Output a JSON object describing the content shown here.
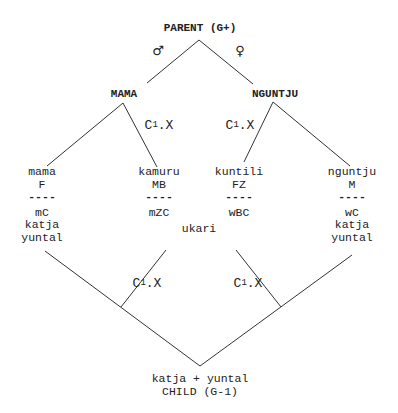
{
  "diagram": {
    "top": {
      "label": "PARENT (G+)"
    },
    "symbols": {
      "male": "♂",
      "female": "♀"
    },
    "parents": [
      {
        "id": "mama",
        "label": "MAMA"
      },
      {
        "id": "nguntju",
        "label": "NGUNTJU"
      }
    ],
    "relation_label": {
      "base": "C",
      "superscript": "1",
      "suffix": ".X"
    },
    "columns": [
      {
        "term": "mama",
        "gloss": "F",
        "separator": "----",
        "lines": [
          "mC",
          "katja",
          "yuntal"
        ]
      },
      {
        "term": "kamuru",
        "gloss": "MB",
        "separator": "----",
        "lines": [
          "mZC"
        ]
      },
      {
        "term": "kuntili",
        "gloss": "FZ",
        "separator": "----",
        "lines": [
          "wBC"
        ]
      },
      {
        "term": "nguntju",
        "gloss": "M",
        "separator": "----",
        "lines": [
          "wC",
          "katja",
          "yuntal"
        ]
      }
    ],
    "middle": {
      "label": "ukari"
    },
    "bottom": {
      "line1": "katja + yuntal",
      "line2": "CHILD (G-1)"
    }
  },
  "colors": {
    "ink": "#222222",
    "background": "#ffffff"
  }
}
